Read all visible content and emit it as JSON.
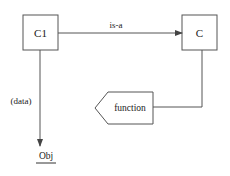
{
  "diagram": {
    "nodes": {
      "c1": {
        "label": "C1"
      },
      "c": {
        "label": "C"
      },
      "function": {
        "label": "function"
      },
      "obj": {
        "label": "Obj"
      }
    },
    "edges": {
      "is_a": {
        "label": "is-a",
        "from": "C1",
        "to": "C"
      },
      "data": {
        "label": "(data)",
        "from": "C1",
        "to": "Obj"
      },
      "c_to_function": {
        "label": "",
        "from": "C",
        "to": "function"
      }
    },
    "colors": {
      "stroke": "#555555",
      "text": "#1a1a1a",
      "background": "#ffffff"
    }
  }
}
